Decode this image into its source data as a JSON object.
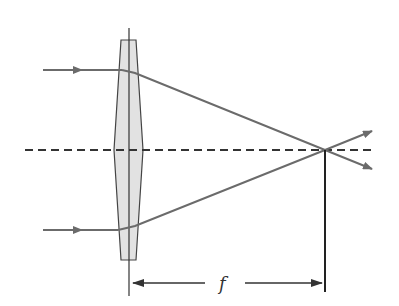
{
  "diagram": {
    "focal_label": "f",
    "colors": {
      "ray": "#6b6b6b",
      "lens_fill": "#e2e2e2",
      "line": "#333333"
    }
  }
}
